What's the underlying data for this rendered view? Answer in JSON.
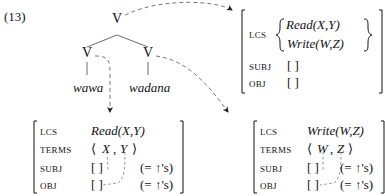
{
  "example_number": "(13)",
  "tree": {
    "root": {
      "label": "V"
    },
    "children": [
      {
        "label": "V",
        "word": "wawa"
      },
      {
        "label": "V",
        "word": "wadana"
      }
    ]
  },
  "avm_root": {
    "features": [
      {
        "name": "LCS",
        "values": [
          "Read(X,Y)",
          "Write(W,Z)"
        ]
      },
      {
        "name": "SUBJ",
        "value": "[ ]"
      },
      {
        "name": "OBJ",
        "value": "[ ]"
      }
    ]
  },
  "avm_left": {
    "lcs_label": "LCS",
    "lcs_value": "Read(X,Y)",
    "terms_label": "TERMS",
    "terms_open": "⟨",
    "terms_a": "X",
    "terms_sep": ",",
    "terms_b": "Y",
    "terms_close": "⟩",
    "subj_label": "SUBJ",
    "subj_value": "[ ]",
    "subj_eq": "(= ↑'s)",
    "obj_label": "OBJ",
    "obj_value": "[ ]",
    "obj_eq": "(= ↑'s)"
  },
  "avm_right": {
    "lcs_label": "LCS",
    "lcs_value": "Write(W,Z)",
    "terms_label": "TERMS",
    "terms_open": "⟨",
    "terms_a": "W",
    "terms_sep": ",",
    "terms_b": "Z",
    "terms_close": "⟩",
    "subj_label": "SUBJ",
    "subj_value": "[ ]",
    "subj_eq": "(= ↑'s)",
    "obj_label": "OBJ",
    "obj_value": "[ ]",
    "obj_eq": "(= ↑'s)"
  }
}
